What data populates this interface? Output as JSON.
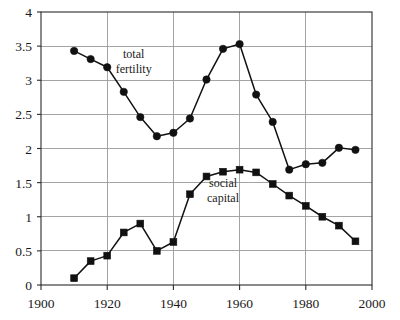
{
  "chart_data": {
    "type": "line",
    "title": "",
    "subtitle": "",
    "xlabel": "",
    "ylabel": "",
    "xlim": [
      1900,
      2000
    ],
    "ylim": [
      0,
      4
    ],
    "grid": true,
    "legend_position": "inline-annotation",
    "x_ticks": [
      "1900",
      "1920",
      "1940",
      "1960",
      "1980",
      "2000"
    ],
    "x_tick_values": [
      1900,
      1920,
      1940,
      1960,
      1980,
      2000
    ],
    "y_ticks": [
      "0",
      "0.5",
      "1",
      "1.5",
      "2",
      "2.5",
      "3",
      "3.5",
      "4"
    ],
    "y_tick_values": [
      0,
      0.5,
      1,
      1.5,
      2,
      2.5,
      3,
      3.5,
      4
    ],
    "x": [
      1910,
      1915,
      1920,
      1925,
      1930,
      1935,
      1940,
      1945,
      1950,
      1955,
      1960,
      1965,
      1970,
      1975,
      1980,
      1985,
      1990,
      1995
    ],
    "series": [
      {
        "name": "total fertility",
        "marker": "circle",
        "color": "#111111",
        "values": [
          3.43,
          3.31,
          3.19,
          2.83,
          2.46,
          2.18,
          2.23,
          2.44,
          3.01,
          3.46,
          3.53,
          2.79,
          2.39,
          1.69,
          1.77,
          1.79,
          2.01,
          1.98
        ]
      },
      {
        "name": "social capital",
        "marker": "square",
        "color": "#111111",
        "values": [
          0.1,
          0.35,
          0.43,
          0.77,
          0.9,
          0.5,
          0.63,
          1.33,
          1.59,
          1.66,
          1.69,
          1.65,
          1.48,
          1.31,
          1.16,
          1.0,
          0.87,
          0.64
        ]
      }
    ],
    "annotations": [
      {
        "name": "total-fertility-label",
        "lines": [
          "total",
          "fertility"
        ],
        "x": 1928,
        "y": 3.33
      },
      {
        "name": "social-capital-label",
        "lines": [
          "social",
          "capital"
        ],
        "x": 1955,
        "y": 1.43
      }
    ]
  }
}
